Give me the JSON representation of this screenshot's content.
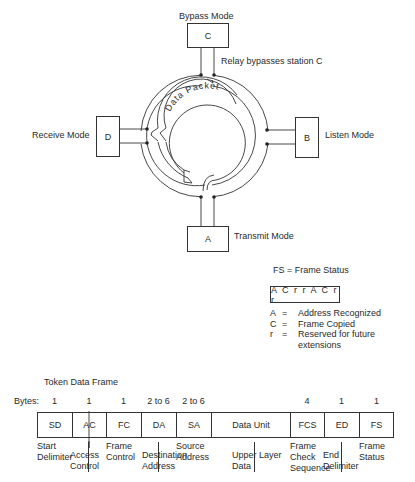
{
  "ring": {
    "stations": {
      "C": {
        "letter": "C",
        "mode": "Bypass Mode"
      },
      "B": {
        "letter": "B",
        "mode": "Listen Mode"
      },
      "D": {
        "letter": "D",
        "mode": "Receive Mode"
      },
      "A": {
        "letter": "A",
        "mode": "Transmit Mode"
      }
    },
    "relay_note": "Relay bypasses station C",
    "packet_label": "Data Packet"
  },
  "fs_legend": {
    "title": "FS = Frame Status",
    "bits": "A C r r A C r r",
    "items": [
      {
        "key": "A",
        "eq": "=",
        "desc": "Address Recognized"
      },
      {
        "key": "C",
        "eq": "=",
        "desc": "Frame Copied"
      },
      {
        "key": "r",
        "eq": "=",
        "desc": "Reserved for future"
      },
      {
        "key": "",
        "eq": "",
        "desc": "extensions"
      }
    ]
  },
  "frame": {
    "title": "Token Data Frame",
    "bytes_label": "Bytes:",
    "fields": [
      {
        "abbr": "SD",
        "bytes": "1",
        "desc": "Start Delimiter"
      },
      {
        "abbr": "AC",
        "bytes": "1",
        "desc": "Access Control"
      },
      {
        "abbr": "FC",
        "bytes": "1",
        "desc": "Frame Control"
      },
      {
        "abbr": "DA",
        "bytes": "2 to 6",
        "desc": "Destination Address"
      },
      {
        "abbr": "SA",
        "bytes": "2 to 6",
        "desc": "Source Address"
      },
      {
        "abbr": "Data Unit",
        "bytes": "",
        "desc": "Upper Layer Data"
      },
      {
        "abbr": "FCS",
        "bytes": "4",
        "desc": "Frame Check Sequence"
      },
      {
        "abbr": "ED",
        "bytes": "1",
        "desc": "End Delimiter"
      },
      {
        "abbr": "FS",
        "bytes": "1",
        "desc": "Frame Status"
      }
    ],
    "desc_lines": {
      "SD": [
        "Start",
        "Delimiter"
      ],
      "AC": [
        "Access",
        "Control"
      ],
      "FC": [
        "Frame",
        "Control"
      ],
      "DA": [
        "Destination",
        "Address"
      ],
      "SA": [
        "Source",
        "Address"
      ],
      "DU": [
        "Upper Layer",
        "Data"
      ],
      "FCS": [
        "Frame",
        "Check",
        "Sequence"
      ],
      "ED": [
        "End",
        "Delimiter"
      ],
      "FS": [
        "Frame",
        "Status"
      ]
    }
  },
  "colors": {
    "line": "#333333",
    "text": "#2a2a2a",
    "background": "#ffffff"
  }
}
